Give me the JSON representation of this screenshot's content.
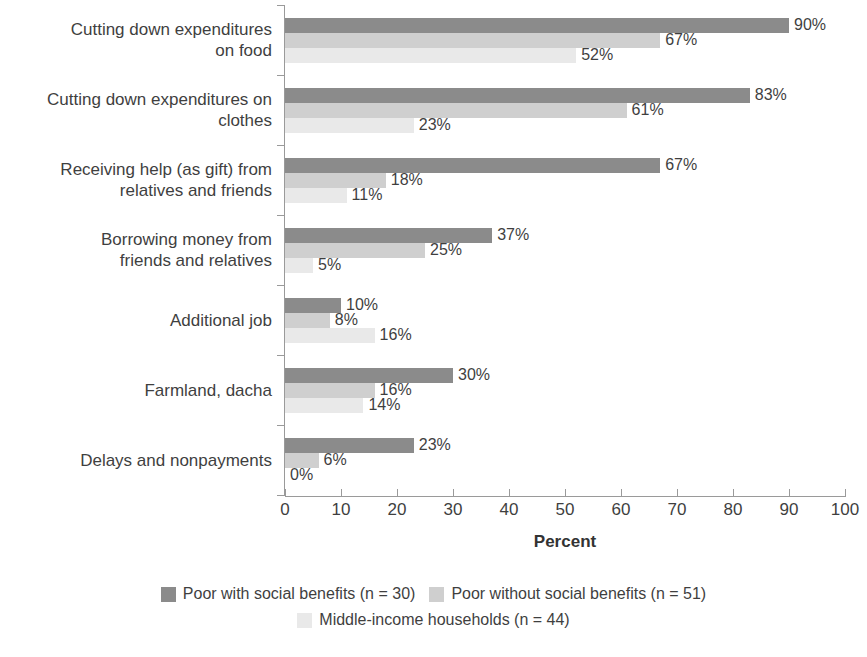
{
  "chart_data": {
    "type": "bar",
    "orientation": "horizontal",
    "title": "",
    "xlabel": "Percent",
    "ylabel": "",
    "xlim": [
      0,
      100
    ],
    "xticks": [
      0,
      10,
      20,
      30,
      40,
      50,
      60,
      70,
      80,
      90,
      100
    ],
    "grid": false,
    "legend_position": "bottom",
    "value_suffix": "%",
    "categories": [
      "Cutting down expenditures on food",
      "Cutting down expenditures on clothes",
      "Receiving help (as gift) from relatives and friends",
      "Borrowing money from friends and relatives",
      "Additional job",
      "Farmland, dacha",
      "Delays and nonpayments"
    ],
    "category_labels_wrapped": [
      "Cutting down expenditures\non food",
      "Cutting down expenditures on\nclothes",
      "Receiving help (as gift) from\nrelatives and friends",
      "Borrowing money from\nfriends and relatives",
      "Additional job",
      "Farmland, dacha",
      "Delays and nonpayments"
    ],
    "series": [
      {
        "name": "Poor with social benefits (n = 30)",
        "color": "#8b8b8b",
        "values": [
          90,
          83,
          67,
          37,
          10,
          30,
          23
        ],
        "labels": [
          "90%",
          "83%",
          "67%",
          "37%",
          "10%",
          "30%",
          "23%"
        ]
      },
      {
        "name": "Poor without social benefits (n = 51)",
        "color": "#cfcfcf",
        "values": [
          67,
          61,
          18,
          25,
          8,
          16,
          6
        ],
        "labels": [
          "67%",
          "61%",
          "18%",
          "25%",
          "8%",
          "16%",
          "6%"
        ]
      },
      {
        "name": "Middle-income households (n = 44)",
        "color": "#e9e9e9",
        "values": [
          52,
          23,
          11,
          5,
          16,
          14,
          0
        ],
        "labels": [
          "52%",
          "23%",
          "11%",
          "5%",
          "16%",
          "14%",
          "0%"
        ]
      }
    ]
  },
  "axis": {
    "x_title": "Percent",
    "x_tick_labels": [
      "0",
      "10",
      "20",
      "30",
      "40",
      "50",
      "60",
      "70",
      "80",
      "90",
      "100"
    ]
  },
  "legend": {
    "rows": [
      [
        {
          "label": "Poor with social benefits (n = 30)",
          "series": 0
        },
        {
          "label": "Poor without social benefits (n = 51)",
          "series": 1
        }
      ],
      [
        {
          "label": "Middle-income households (n = 44)",
          "series": 2
        }
      ]
    ]
  },
  "colors": {
    "series_0": "#8b8b8b",
    "series_1": "#cfcfcf",
    "series_2": "#e9e9e9",
    "axis": "#9a9a9a",
    "text": "#3f3f3f",
    "background": "#ffffff"
  }
}
